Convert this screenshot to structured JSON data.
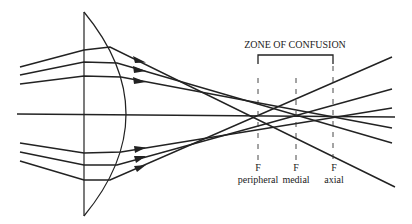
{
  "title": "ZONE OF CONFUSION",
  "focal_points": [
    {
      "letter": "F",
      "name": "peripheral",
      "x": 257
    },
    {
      "letter": "F",
      "name": "medial",
      "x": 296
    },
    {
      "letter": "F",
      "name": "axial",
      "x": 333
    }
  ],
  "colors": {
    "line": "#222222",
    "background": "#ffffff"
  },
  "lens": {
    "type": "plano-convex",
    "flat_x": 84,
    "apex_x": 126,
    "top_y": 12,
    "bottom_y": 216
  },
  "axis": {
    "y_left": 114,
    "y_right": 117
  },
  "rays": {
    "upper": [
      {
        "name": "peripheral",
        "pts": [
          [
            20,
            67
          ],
          [
            84,
            50
          ],
          [
            110,
            47
          ],
          [
            395,
            187
          ]
        ]
      },
      {
        "name": "medial",
        "pts": [
          [
            20,
            75
          ],
          [
            84,
            62
          ],
          [
            117,
            63
          ],
          [
            392,
            143
          ]
        ]
      },
      {
        "name": "axial",
        "pts": [
          [
            20,
            84
          ],
          [
            84,
            76
          ],
          [
            121,
            77
          ],
          [
            392,
            128
          ]
        ]
      }
    ],
    "lower": [
      {
        "name": "axial",
        "pts": [
          [
            20,
            143
          ],
          [
            84,
            153
          ],
          [
            121,
            152
          ],
          [
            392,
            108
          ]
        ]
      },
      {
        "name": "medial",
        "pts": [
          [
            20,
            152
          ],
          [
            84,
            165
          ],
          [
            117,
            165
          ],
          [
            392,
            89
          ]
        ]
      },
      {
        "name": "peripheral",
        "pts": [
          [
            20,
            161
          ],
          [
            84,
            180
          ],
          [
            110,
            180
          ],
          [
            392,
            57
          ]
        ]
      }
    ]
  },
  "arrowheads": [
    [
      140,
      60
    ],
    [
      140,
      69
    ],
    [
      140,
      80
    ],
    [
      140,
      149
    ],
    [
      140,
      158
    ],
    [
      140,
      167
    ]
  ]
}
